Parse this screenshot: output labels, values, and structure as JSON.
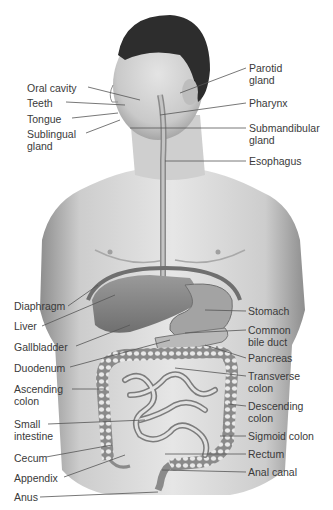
{
  "diagram": {
    "left_labels": [
      {
        "id": "oral-cavity",
        "text": "Oral cavity",
        "x": 27,
        "y": 82
      },
      {
        "id": "teeth",
        "text": "Teeth",
        "x": 27,
        "y": 97
      },
      {
        "id": "tongue",
        "text": "Tongue",
        "x": 27,
        "y": 113
      },
      {
        "id": "sublingual-gland",
        "text": "Sublingual\ngland",
        "x": 27,
        "y": 128
      },
      {
        "id": "diaphragm",
        "text": "Diaphragm",
        "x": 14,
        "y": 300
      },
      {
        "id": "liver",
        "text": "Liver",
        "x": 14,
        "y": 320
      },
      {
        "id": "gallbladder",
        "text": "Gallbladder",
        "x": 14,
        "y": 341
      },
      {
        "id": "duodenum",
        "text": "Duodenum",
        "x": 14,
        "y": 362
      },
      {
        "id": "ascending-colon",
        "text": "Ascending\ncolon",
        "x": 14,
        "y": 383
      },
      {
        "id": "small-intestine",
        "text": "Small\nintestine",
        "x": 14,
        "y": 418
      },
      {
        "id": "cecum",
        "text": "Cecum",
        "x": 14,
        "y": 452
      },
      {
        "id": "appendix",
        "text": "Appendix",
        "x": 14,
        "y": 472
      },
      {
        "id": "anus",
        "text": "Anus",
        "x": 14,
        "y": 491
      }
    ],
    "right_labels": [
      {
        "id": "parotid-gland",
        "text": "Parotid\ngland",
        "x": 249,
        "y": 62
      },
      {
        "id": "pharynx",
        "text": "Pharynx",
        "x": 249,
        "y": 97
      },
      {
        "id": "submandibular-gland",
        "text": "Submandibular\ngland",
        "x": 249,
        "y": 122
      },
      {
        "id": "esophagus",
        "text": "Esophagus",
        "x": 249,
        "y": 155
      },
      {
        "id": "stomach",
        "text": "Stomach",
        "x": 248,
        "y": 305
      },
      {
        "id": "common-bile-duct",
        "text": "Common\nbile duct",
        "x": 248,
        "y": 324
      },
      {
        "id": "pancreas",
        "text": "Pancreas",
        "x": 248,
        "y": 352
      },
      {
        "id": "transverse-colon",
        "text": "Transverse\ncolon",
        "x": 248,
        "y": 370
      },
      {
        "id": "descending-colon",
        "text": "Descending\ncolon",
        "x": 248,
        "y": 400
      },
      {
        "id": "sigmoid-colon",
        "text": "Sigmoid colon",
        "x": 248,
        "y": 430
      },
      {
        "id": "rectum",
        "text": "Rectum",
        "x": 248,
        "y": 448
      },
      {
        "id": "anal-canal",
        "text": "Anal canal",
        "x": 248,
        "y": 466
      }
    ]
  }
}
